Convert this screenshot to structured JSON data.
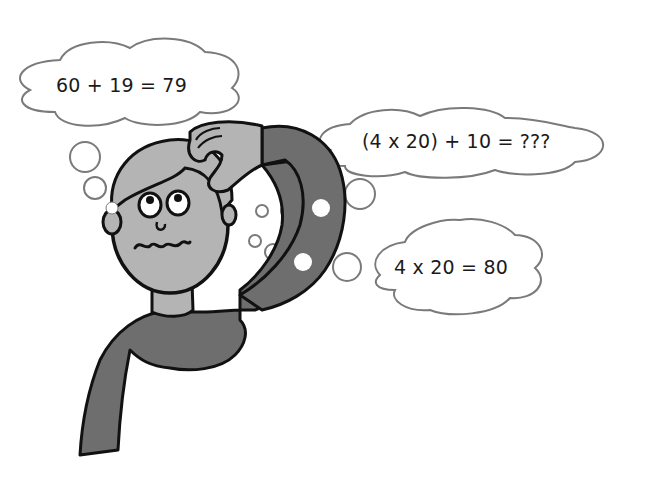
{
  "illustration": {
    "subject": "confused person scratching head doing mental math",
    "colors": {
      "background": "#ffffff",
      "skin": "#b4b4b4",
      "shirt": "#6e6e6e",
      "outline": "#111111",
      "bubble_stroke": "#7a7a7a"
    }
  },
  "thoughts": [
    {
      "id": "thought-1",
      "text": "60 + 19 = 79"
    },
    {
      "id": "thought-2",
      "text": "(4 x 20) + 10 = ???"
    },
    {
      "id": "thought-3",
      "text": "4 x 20 = 80"
    }
  ]
}
